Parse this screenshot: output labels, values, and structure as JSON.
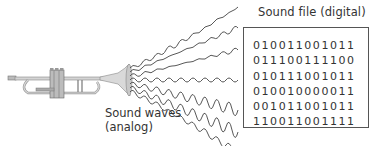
{
  "digital": {
    "title": "Sound file (digital)",
    "rows": [
      "010011001011",
      "011100111100",
      "010111001011",
      "010010000011",
      "001011001011",
      "110011001111"
    ]
  },
  "analog": {
    "label_line1": "Sound waves",
    "label_line2": "(analog)"
  },
  "instrument": {
    "name": "trumpet"
  },
  "colors": {
    "text": "#333333",
    "box_border": "#555555",
    "wave": "#444444",
    "brass": "#c9c9c9"
  }
}
